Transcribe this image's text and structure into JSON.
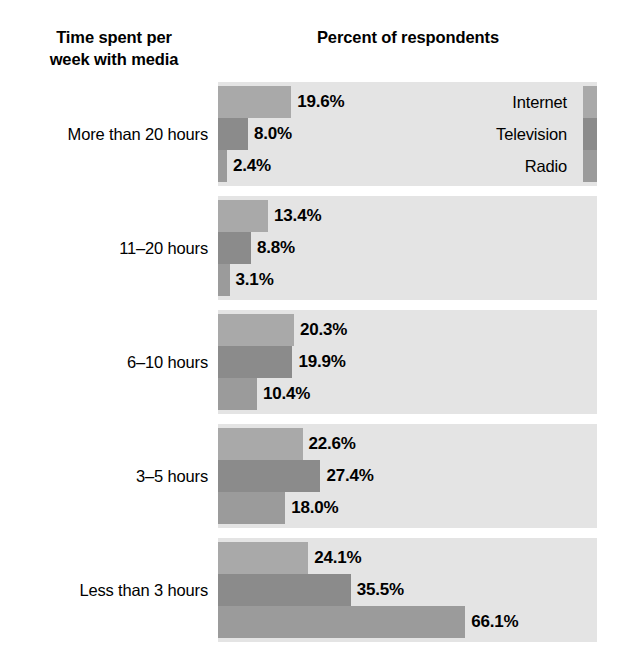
{
  "headers": {
    "category_axis_title": "Time spent per\nweek with media",
    "value_axis_title": "Percent of respondents"
  },
  "legend": {
    "items": [
      {
        "label": "Internet",
        "color": "#a9a9a9"
      },
      {
        "label": "Television",
        "color": "#8b8b8b"
      },
      {
        "label": "Radio",
        "color": "#9b9b9b"
      }
    ]
  },
  "chart_data": {
    "type": "bar",
    "orientation": "horizontal",
    "grouped": true,
    "title": "Percent of respondents",
    "xlabel": "Percent of respondents",
    "ylabel": "Time spent per week with media",
    "xlim": [
      0,
      100
    ],
    "grid": false,
    "legend_position": "inside-top-right-first-group",
    "value_suffix": "%",
    "categories": [
      "More than 20 hours",
      "11–20 hours",
      "6–10 hours",
      "3–5 hours",
      "Less than 3 hours"
    ],
    "series": [
      {
        "name": "Internet",
        "color": "#a9a9a9",
        "values": [
          19.6,
          13.4,
          20.3,
          22.6,
          24.1
        ]
      },
      {
        "name": "Television",
        "color": "#8b8b8b",
        "values": [
          8.0,
          8.8,
          19.9,
          27.4,
          35.5
        ]
      },
      {
        "name": "Radio",
        "color": "#9b9b9b",
        "values": [
          2.4,
          3.1,
          10.4,
          18.0,
          66.1
        ]
      }
    ],
    "value_labels": [
      [
        "19.6%",
        "8.0%",
        "2.4%"
      ],
      [
        "13.4%",
        "8.8%",
        "3.1%"
      ],
      [
        "20.3%",
        "19.9%",
        "10.4%"
      ],
      [
        "22.6%",
        "27.4%",
        "18.0%"
      ],
      [
        "24.1%",
        "35.5%",
        "66.1%"
      ]
    ]
  },
  "groups": [
    {
      "label": "More than 20 hours",
      "bars": [
        {
          "series": "Internet",
          "value": 19.6,
          "label": "19.6%"
        },
        {
          "series": "Television",
          "value": 8.0,
          "label": "8.0%"
        },
        {
          "series": "Radio",
          "value": 2.4,
          "label": "2.4%"
        }
      ]
    },
    {
      "label": "11–20 hours",
      "bars": [
        {
          "series": "Internet",
          "value": 13.4,
          "label": "13.4%"
        },
        {
          "series": "Television",
          "value": 8.8,
          "label": "8.8%"
        },
        {
          "series": "Radio",
          "value": 3.1,
          "label": "3.1%"
        }
      ]
    },
    {
      "label": "6–10 hours",
      "bars": [
        {
          "series": "Internet",
          "value": 20.3,
          "label": "20.3%"
        },
        {
          "series": "Television",
          "value": 19.9,
          "label": "19.9%"
        },
        {
          "series": "Radio",
          "value": 10.4,
          "label": "10.4%"
        }
      ]
    },
    {
      "label": "3–5 hours",
      "bars": [
        {
          "series": "Internet",
          "value": 22.6,
          "label": "22.6%"
        },
        {
          "series": "Television",
          "value": 27.4,
          "label": "27.4%"
        },
        {
          "series": "Radio",
          "value": 18.0,
          "label": "18.0%"
        }
      ]
    },
    {
      "label": "Less than 3 hours",
      "bars": [
        {
          "series": "Internet",
          "value": 24.1,
          "label": "24.1%"
        },
        {
          "series": "Television",
          "value": 35.5,
          "label": "35.5%"
        },
        {
          "series": "Radio",
          "value": 66.1,
          "label": "66.1%"
        }
      ]
    }
  ]
}
